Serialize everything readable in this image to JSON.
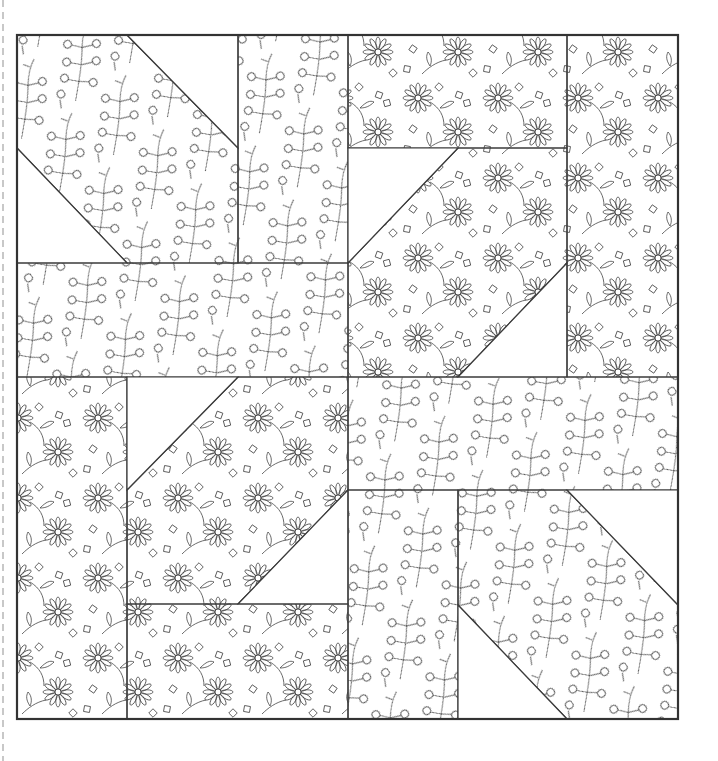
{
  "page": {
    "title": "",
    "background": "#ffffff",
    "line_color": "#333333"
  },
  "quilt": {
    "frame": {
      "x": 17,
      "y": 35,
      "width": 661,
      "height": 684
    },
    "fabrics": [
      {
        "id": "berry",
        "name": "berry-branch-print"
      },
      {
        "id": "daisy",
        "name": "daisy-floral-print"
      },
      {
        "id": "plain",
        "name": "plain-white"
      }
    ],
    "pieces": [
      {
        "name": "tl-square-left",
        "fabric": "berry",
        "points": "17,35 127,35 238,148 238,263 127,263 17,148"
      },
      {
        "name": "tl-blank-top",
        "fabric": "plain",
        "points": "127,35 238,35 238,148"
      },
      {
        "name": "tl-blank-bottom",
        "fabric": "plain",
        "points": "17,148 127,263 17,263"
      },
      {
        "name": "tl-rect-right",
        "fabric": "berry",
        "points": "238,35 348,35 348,263 238,263"
      },
      {
        "name": "tl-rect-bottom",
        "fabric": "berry",
        "points": "17,263 348,263 348,377 17,377"
      },
      {
        "name": "tr-rect-top",
        "fabric": "daisy",
        "points": "348,35 567,35 567,148 348,148"
      },
      {
        "name": "tr-parallelogram",
        "fabric": "daisy",
        "points": "458,148 567,148 567,263 458,377 348,377 348,263"
      },
      {
        "name": "tr-blank-top",
        "fabric": "plain",
        "points": "348,148 458,148 348,263"
      },
      {
        "name": "tr-blank-bottom",
        "fabric": "plain",
        "points": "567,263 567,377 458,377"
      },
      {
        "name": "tr-rect-right",
        "fabric": "daisy",
        "points": "567,35 678,35 678,377 567,377"
      },
      {
        "name": "bl-rect-left",
        "fabric": "daisy",
        "points": "17,377 127,377 127,719 17,719"
      },
      {
        "name": "bl-parallelogram",
        "fabric": "daisy",
        "points": "127,490 238,377 348,377 348,490 238,604 127,604"
      },
      {
        "name": "bl-blank-top",
        "fabric": "plain",
        "points": "127,377 238,377 127,490"
      },
      {
        "name": "bl-blank-bottom",
        "fabric": "plain",
        "points": "348,490 348,604 238,604"
      },
      {
        "name": "bl-rect-bottom",
        "fabric": "daisy",
        "points": "127,604 348,604 348,719 127,719"
      },
      {
        "name": "br-rect-top",
        "fabric": "berry",
        "points": "348,377 678,377 678,490 348,490"
      },
      {
        "name": "br-rect-left",
        "fabric": "berry",
        "points": "348,490 458,490 458,719 348,719"
      },
      {
        "name": "br-square",
        "fabric": "berry",
        "points": "458,490 567,490 678,605 678,719 567,719 458,605"
      },
      {
        "name": "br-blank-top",
        "fabric": "plain",
        "points": "567,490 678,490 678,605"
      },
      {
        "name": "br-blank-bottom",
        "fabric": "plain",
        "points": "458,605 567,719 458,719"
      }
    ]
  }
}
